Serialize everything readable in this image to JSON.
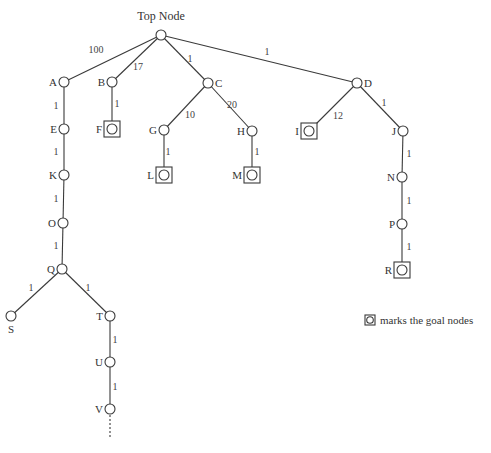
{
  "diagram": {
    "root_label": "Top Node",
    "legend_text": "marks the goal nodes",
    "nodes": [
      {
        "id": "top",
        "label": "",
        "x": 161,
        "y": 35,
        "goal": false
      },
      {
        "id": "A",
        "label": "A",
        "x": 64,
        "y": 82,
        "goal": false,
        "label_side": "left"
      },
      {
        "id": "B",
        "label": "B",
        "x": 112,
        "y": 82,
        "goal": false,
        "label_side": "left"
      },
      {
        "id": "C",
        "label": "C",
        "x": 208,
        "y": 83,
        "goal": false,
        "label_side": "right"
      },
      {
        "id": "D",
        "label": "D",
        "x": 357,
        "y": 83,
        "goal": false,
        "label_side": "right"
      },
      {
        "id": "E",
        "label": "E",
        "x": 64,
        "y": 129,
        "goal": false,
        "label_side": "left"
      },
      {
        "id": "F",
        "label": "F",
        "x": 112,
        "y": 129,
        "goal": true,
        "label_side": "left"
      },
      {
        "id": "G",
        "label": "G",
        "x": 164,
        "y": 130,
        "goal": false,
        "label_side": "left"
      },
      {
        "id": "H",
        "label": "H",
        "x": 252,
        "y": 131,
        "goal": false,
        "label_side": "left"
      },
      {
        "id": "I",
        "label": "I",
        "x": 309,
        "y": 131,
        "goal": true,
        "label_side": "left"
      },
      {
        "id": "J",
        "label": "J",
        "x": 403,
        "y": 131,
        "goal": false,
        "label_side": "left"
      },
      {
        "id": "K",
        "label": "K",
        "x": 64,
        "y": 175,
        "goal": false,
        "label_side": "left"
      },
      {
        "id": "L",
        "label": "L",
        "x": 164,
        "y": 175,
        "goal": true,
        "label_side": "left"
      },
      {
        "id": "M",
        "label": "M",
        "x": 252,
        "y": 175,
        "goal": true,
        "label_side": "left"
      },
      {
        "id": "N",
        "label": "N",
        "x": 402,
        "y": 177,
        "goal": false,
        "label_side": "left"
      },
      {
        "id": "O",
        "label": "O",
        "x": 63,
        "y": 223,
        "goal": false,
        "label_side": "left"
      },
      {
        "id": "P",
        "label": "P",
        "x": 402,
        "y": 224,
        "goal": false,
        "label_side": "left"
      },
      {
        "id": "Q",
        "label": "Q",
        "x": 62,
        "y": 269,
        "goal": false,
        "label_side": "left"
      },
      {
        "id": "R",
        "label": "R",
        "x": 402,
        "y": 270,
        "goal": true,
        "label_side": "left"
      },
      {
        "id": "S",
        "label": "S",
        "x": 11,
        "y": 316,
        "goal": false,
        "label_side": "below"
      },
      {
        "id": "T",
        "label": "T",
        "x": 110,
        "y": 316,
        "goal": false,
        "label_side": "left"
      },
      {
        "id": "U",
        "label": "U",
        "x": 110,
        "y": 362,
        "goal": false,
        "label_side": "left"
      },
      {
        "id": "V",
        "label": "V",
        "x": 110,
        "y": 409,
        "goal": false,
        "label_side": "left"
      }
    ],
    "edges": [
      {
        "from": "top",
        "to": "A",
        "weight": "100",
        "lx": 96,
        "ly": 53
      },
      {
        "from": "top",
        "to": "B",
        "weight": "17",
        "lx": 138,
        "ly": 70
      },
      {
        "from": "top",
        "to": "C",
        "weight": "1",
        "lx": 190,
        "ly": 62
      },
      {
        "from": "top",
        "to": "D",
        "weight": "1",
        "lx": 267,
        "ly": 55
      },
      {
        "from": "A",
        "to": "E",
        "weight": "1",
        "lx": 56,
        "ly": 109
      },
      {
        "from": "B",
        "to": "F",
        "weight": "1",
        "lx": 117,
        "ly": 107
      },
      {
        "from": "C",
        "to": "G",
        "weight": "10",
        "lx": 190,
        "ly": 118
      },
      {
        "from": "C",
        "to": "H",
        "weight": "20",
        "lx": 232,
        "ly": 108
      },
      {
        "from": "D",
        "to": "I",
        "weight": "12",
        "lx": 338,
        "ly": 119
      },
      {
        "from": "D",
        "to": "J",
        "weight": "1",
        "lx": 384,
        "ly": 106
      },
      {
        "from": "E",
        "to": "K",
        "weight": "1",
        "lx": 56,
        "ly": 155
      },
      {
        "from": "G",
        "to": "L",
        "weight": "1",
        "lx": 168,
        "ly": 155
      },
      {
        "from": "H",
        "to": "M",
        "weight": "1",
        "lx": 257,
        "ly": 155
      },
      {
        "from": "J",
        "to": "N",
        "weight": "1",
        "lx": 409,
        "ly": 157
      },
      {
        "from": "K",
        "to": "O",
        "weight": "1",
        "lx": 56,
        "ly": 202
      },
      {
        "from": "N",
        "to": "P",
        "weight": "1",
        "lx": 409,
        "ly": 204
      },
      {
        "from": "O",
        "to": "Q",
        "weight": "1",
        "lx": 56,
        "ly": 249
      },
      {
        "from": "P",
        "to": "R",
        "weight": "1",
        "lx": 409,
        "ly": 250
      },
      {
        "from": "Q",
        "to": "S",
        "weight": "1",
        "lx": 31,
        "ly": 291
      },
      {
        "from": "Q",
        "to": "T",
        "weight": "1",
        "lx": 88,
        "ly": 291
      },
      {
        "from": "T",
        "to": "U",
        "weight": "1",
        "lx": 115,
        "ly": 343
      },
      {
        "from": "U",
        "to": "V",
        "weight": "1",
        "lx": 115,
        "ly": 390
      }
    ],
    "continuation": {
      "from": "V",
      "x": 110,
      "y1": 415,
      "y2": 438
    }
  }
}
